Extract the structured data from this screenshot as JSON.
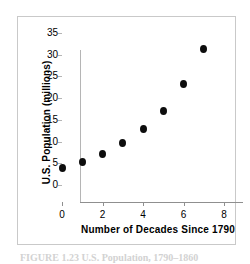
{
  "figure": {
    "caption": "FIGURE 1.23  U.S. Population, 1790–1860"
  },
  "chart_data": {
    "type": "scatter",
    "title": "",
    "xlabel": "Number of Decades Since 1790",
    "ylabel": "U.S. Population (millions)",
    "xlim": [
      0,
      8
    ],
    "ylim": [
      0,
      35
    ],
    "xticks": [
      "0",
      "2",
      "4",
      "6",
      "8"
    ],
    "xtick_values": [
      0,
      2,
      4,
      6,
      8
    ],
    "yticks": [
      "0",
      "5",
      "10",
      "15",
      "20",
      "25",
      "30",
      "35"
    ],
    "ytick_values": [
      0,
      5,
      10,
      15,
      20,
      25,
      30,
      35
    ],
    "grid": false,
    "legend": null,
    "marker_color": "#0d0d0d",
    "axis_color": "#8f8f8f",
    "x": [
      0,
      1,
      2,
      3,
      4,
      5,
      6,
      7
    ],
    "values": [
      3.9,
      5.3,
      7.2,
      9.6,
      12.9,
      17.1,
      23.2,
      31.4
    ],
    "points": [
      {
        "x": 0,
        "y": 3.9
      },
      {
        "x": 1,
        "y": 5.3
      },
      {
        "x": 2,
        "y": 7.2
      },
      {
        "x": 3,
        "y": 9.6
      },
      {
        "x": 4,
        "y": 12.9
      },
      {
        "x": 5,
        "y": 17.1
      },
      {
        "x": 6,
        "y": 23.2
      },
      {
        "x": 7,
        "y": 31.4
      }
    ]
  }
}
